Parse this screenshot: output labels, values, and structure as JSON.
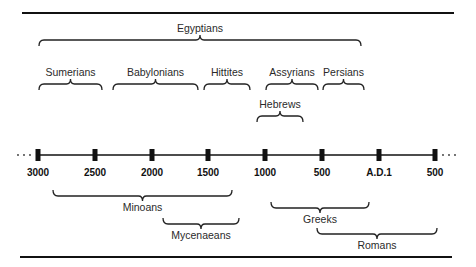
{
  "diagram": {
    "type": "timeline",
    "ellipsis": "···",
    "axis": {
      "y": 155,
      "x_start": 36,
      "x_end": 437,
      "ticks": [
        {
          "label": "3000",
          "x": 38
        },
        {
          "label": "2500",
          "x": 95
        },
        {
          "label": "2000",
          "x": 152
        },
        {
          "label": "1500",
          "x": 208
        },
        {
          "label": "1000",
          "x": 265
        },
        {
          "label": "500",
          "x": 322
        },
        {
          "label": "A.D.1",
          "x": 379
        },
        {
          "label": "500",
          "x": 435
        }
      ]
    },
    "civilizations_above": [
      {
        "name": "Egyptians",
        "x1": 39,
        "x2": 361,
        "y": 40
      },
      {
        "name": "Sumerians",
        "x1": 39,
        "x2": 102,
        "y": 84
      },
      {
        "name": "Babylonians",
        "x1": 113,
        "x2": 198,
        "y": 84
      },
      {
        "name": "Hittites",
        "x1": 204,
        "x2": 250,
        "y": 84
      },
      {
        "name": "Assyrians",
        "x1": 266,
        "x2": 318,
        "y": 84
      },
      {
        "name": "Persians",
        "x1": 323,
        "x2": 364,
        "y": 84
      },
      {
        "name": "Hebrews",
        "x1": 257,
        "x2": 303,
        "y": 116
      }
    ],
    "civilizations_below": [
      {
        "name": "Minoans",
        "x1": 53,
        "x2": 232,
        "y": 196
      },
      {
        "name": "Mycenaeans",
        "x1": 163,
        "x2": 239,
        "y": 224
      },
      {
        "name": "Greeks",
        "x1": 271,
        "x2": 369,
        "y": 208
      },
      {
        "name": "Romans",
        "x1": 317,
        "x2": 437,
        "y": 234
      }
    ]
  }
}
